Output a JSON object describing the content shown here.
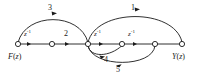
{
  "figure": {
    "type": "signal-flow-graph",
    "stroke_color": "#1a1a1a",
    "node_fill": "#ffffff",
    "background": "#ffffff"
  },
  "terminals": {
    "input": {
      "label_var": "F",
      "label_open": "(",
      "label_arg": "z",
      "label_close": ")",
      "label_full": "F(z)"
    },
    "output": {
      "label_var": "Y",
      "label_open": "(",
      "label_arg": "z",
      "label_close": ")",
      "label_full": "Y(z)"
    }
  },
  "nodes": [
    {
      "id": "n1",
      "name": "input-node",
      "x": 18,
      "y": 44
    },
    {
      "id": "n2",
      "name": "node-2",
      "x": 52,
      "y": 44
    },
    {
      "id": "n3",
      "name": "node-3",
      "x": 88,
      "y": 44
    },
    {
      "id": "n4",
      "name": "node-4",
      "x": 122,
      "y": 44
    },
    {
      "id": "n5",
      "name": "node-5",
      "x": 155,
      "y": 44
    },
    {
      "id": "n6",
      "name": "output-node",
      "x": 182,
      "y": 44
    }
  ],
  "branches": [
    {
      "id": "b1",
      "name": "branch-n1-n2",
      "from": "n1",
      "to": "n2",
      "gain": "z⁻¹",
      "gain_base": "z",
      "gain_exp": "-1",
      "label_x": 29,
      "label_y": 32,
      "path": "straight"
    },
    {
      "id": "b2",
      "name": "branch-n2-n3",
      "from": "n2",
      "to": "n3",
      "gain": "2",
      "label_x": 67,
      "label_y": 31,
      "path": "straight"
    },
    {
      "id": "b3",
      "name": "branch-n3-n4",
      "from": "n3",
      "to": "n4",
      "gain": "z⁻¹",
      "gain_base": "z",
      "gain_exp": "-1",
      "label_x": 99,
      "label_y": 32,
      "path": "straight"
    },
    {
      "id": "b4",
      "name": "branch-n4-n5",
      "from": "n4",
      "to": "n5",
      "gain": "z⁻¹",
      "gain_base": "z",
      "gain_exp": "-1",
      "label_x": 133,
      "label_y": 32,
      "path": "straight"
    },
    {
      "id": "b5",
      "name": "branch-arc-3",
      "from": "n1",
      "to": "n3",
      "gain": "3",
      "label_x": 50,
      "label_y": 6,
      "path": "arc-above"
    },
    {
      "id": "b6",
      "name": "branch-arc-1",
      "from": "n3",
      "to": "n6",
      "gain": "1",
      "label_x": 133,
      "label_y": 6,
      "path": "arc-above"
    },
    {
      "id": "b7",
      "name": "branch-arc-4",
      "from": "n3",
      "to": "n4",
      "gain": "4",
      "label_x": 106,
      "label_y": 57,
      "path": "arc-below"
    },
    {
      "id": "b8",
      "name": "branch-arc-5",
      "from": "n5",
      "to": "n3",
      "gain": "5",
      "label_x": 118,
      "label_y": 67,
      "path": "arc-below"
    }
  ]
}
